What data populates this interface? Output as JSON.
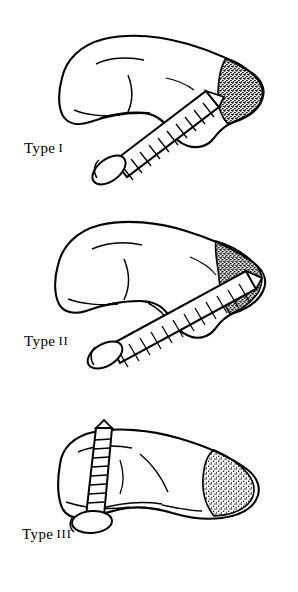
{
  "figure": {
    "title": "",
    "background_color": "#ffffff",
    "ink_color": "#000000",
    "panels": [
      {
        "id": "type-1",
        "caption_label": "Type",
        "caption_numeral": "I",
        "description": "Lateral view of a vertebra with a screw inserted through the articular pillar; stippled fracture surface at the posterior-superior corner."
      },
      {
        "id": "type-2",
        "caption_label": "Type",
        "caption_numeral": "II",
        "description": "Lateral view of a vertebra with a longer screw angled through the pedicle; stippled fracture surface along the posterior margin."
      },
      {
        "id": "type-3",
        "caption_label": "Type",
        "caption_numeral": "III",
        "description": "Lateral view of a vertebra with a short vertical screw at the anterior end; stippled area at the posterior body."
      }
    ]
  }
}
